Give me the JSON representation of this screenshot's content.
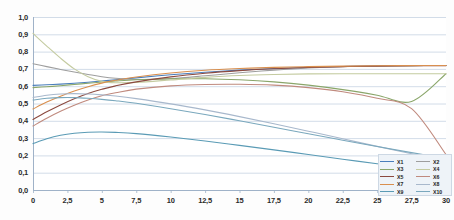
{
  "chart_data": {
    "type": "line",
    "title": "",
    "subtitle": "",
    "xlabel": "",
    "ylabel": "",
    "xlim": [
      0,
      30
    ],
    "ylim": [
      0,
      1
    ],
    "grid": "horizontal",
    "legend_position": "bottom-right",
    "xticks": [
      "0",
      "2,5",
      "5",
      "7,5",
      "10",
      "12,5",
      "15",
      "17,5",
      "20",
      "22,5",
      "25",
      "27,5",
      "30"
    ],
    "xtick_values": [
      0,
      2.5,
      5,
      7.5,
      10,
      12.5,
      15,
      17.5,
      20,
      22.5,
      25,
      27.5,
      30
    ],
    "yticks": [
      "0,0",
      "0,1",
      "0,2",
      "0,3",
      "0,4",
      "0,5",
      "0,6",
      "0,7",
      "0,8",
      "0,9",
      "1,0"
    ],
    "ytick_values": [
      0.0,
      0.1,
      0.2,
      0.3,
      0.4,
      0.5,
      0.6,
      0.7,
      0.8,
      0.9,
      1.0
    ],
    "x": [
      0,
      1,
      2,
      3,
      4,
      5,
      6,
      7.5,
      10,
      12.5,
      15,
      17.5,
      20,
      22.5,
      25,
      27.5,
      30
    ],
    "series": [
      {
        "name": "X1",
        "color": "#4a7ebb",
        "values": [
          0.605,
          0.608,
          0.612,
          0.617,
          0.623,
          0.63,
          0.637,
          0.648,
          0.666,
          0.681,
          0.693,
          0.702,
          0.709,
          0.714,
          0.717,
          0.719,
          0.72
        ]
      },
      {
        "name": "X2",
        "color": "#9e9e9e",
        "values": [
          0.73,
          0.713,
          0.697,
          0.682,
          0.668,
          0.655,
          0.646,
          0.639,
          0.644,
          0.66,
          0.678,
          0.693,
          0.705,
          0.713,
          0.717,
          0.719,
          0.72
        ]
      },
      {
        "name": "X3",
        "color": "#8aa66a",
        "values": [
          0.592,
          0.597,
          0.603,
          0.61,
          0.617,
          0.624,
          0.63,
          0.637,
          0.643,
          0.643,
          0.637,
          0.625,
          0.606,
          0.58,
          0.548,
          0.512,
          0.672
        ]
      },
      {
        "name": "X4",
        "color": "#c4cba0",
        "values": [
          0.905,
          0.832,
          0.762,
          0.7,
          0.655,
          0.628,
          0.62,
          0.622,
          0.636,
          0.651,
          0.662,
          0.668,
          0.671,
          0.672,
          0.672,
          0.672,
          0.672
        ]
      },
      {
        "name": "X5",
        "color": "#8c4a3f",
        "values": [
          0.408,
          0.452,
          0.492,
          0.528,
          0.558,
          0.582,
          0.602,
          0.625,
          0.654,
          0.675,
          0.69,
          0.701,
          0.708,
          0.713,
          0.716,
          0.718,
          0.719
        ]
      },
      {
        "name": "X6",
        "color": "#c08a7e",
        "values": [
          0.37,
          0.415,
          0.455,
          0.49,
          0.52,
          0.545,
          0.562,
          0.583,
          0.602,
          0.61,
          0.611,
          0.606,
          0.592,
          0.568,
          0.53,
          0.47,
          0.205
        ]
      },
      {
        "name": "X7",
        "color": "#d98f4e",
        "values": [
          0.468,
          0.508,
          0.542,
          0.572,
          0.597,
          0.618,
          0.634,
          0.653,
          0.676,
          0.692,
          0.702,
          0.709,
          0.713,
          0.716,
          0.718,
          0.719,
          0.72
        ]
      },
      {
        "name": "X8",
        "color": "#a8b8cc",
        "values": [
          0.535,
          0.548,
          0.555,
          0.557,
          0.555,
          0.55,
          0.543,
          0.528,
          0.498,
          0.463,
          0.424,
          0.383,
          0.34,
          0.296,
          0.252,
          0.21,
          0.17
        ]
      },
      {
        "name": "X9",
        "color": "#5a9bb5",
        "values": [
          0.268,
          0.296,
          0.316,
          0.328,
          0.334,
          0.335,
          0.333,
          0.326,
          0.306,
          0.283,
          0.258,
          0.232,
          0.205,
          0.178,
          0.152,
          0.128,
          0.108
        ]
      },
      {
        "name": "X10",
        "color": "#7aa8bd",
        "values": [
          0.52,
          0.53,
          0.534,
          0.534,
          0.53,
          0.524,
          0.516,
          0.501,
          0.47,
          0.436,
          0.4,
          0.363,
          0.325,
          0.288,
          0.251,
          0.216,
          0.182
        ]
      }
    ]
  },
  "legend": {
    "left_column": [
      {
        "label": "X1",
        "color": "#4a7ebb"
      },
      {
        "label": "X3",
        "color": "#8aa66a"
      },
      {
        "label": "X5",
        "color": "#8c4a3f"
      },
      {
        "label": "X7",
        "color": "#d98f4e"
      },
      {
        "label": "X9",
        "color": "#5a9bb5"
      }
    ],
    "right_column": [
      {
        "label": "X2",
        "color": "#9e9e9e"
      },
      {
        "label": "X4",
        "color": "#c4cba0"
      },
      {
        "label": "X6",
        "color": "#c08a7e"
      },
      {
        "label": "X8",
        "color": "#a8b8cc"
      },
      {
        "label": "X10",
        "color": "#7aa8bd"
      }
    ]
  },
  "style": {
    "grid_color": "#c6d3e2",
    "axis_color": "#9fb2c8",
    "plot_background": "#ffffff",
    "legend_background": "#eef3f8",
    "legend_border": "#cdd8e4"
  }
}
